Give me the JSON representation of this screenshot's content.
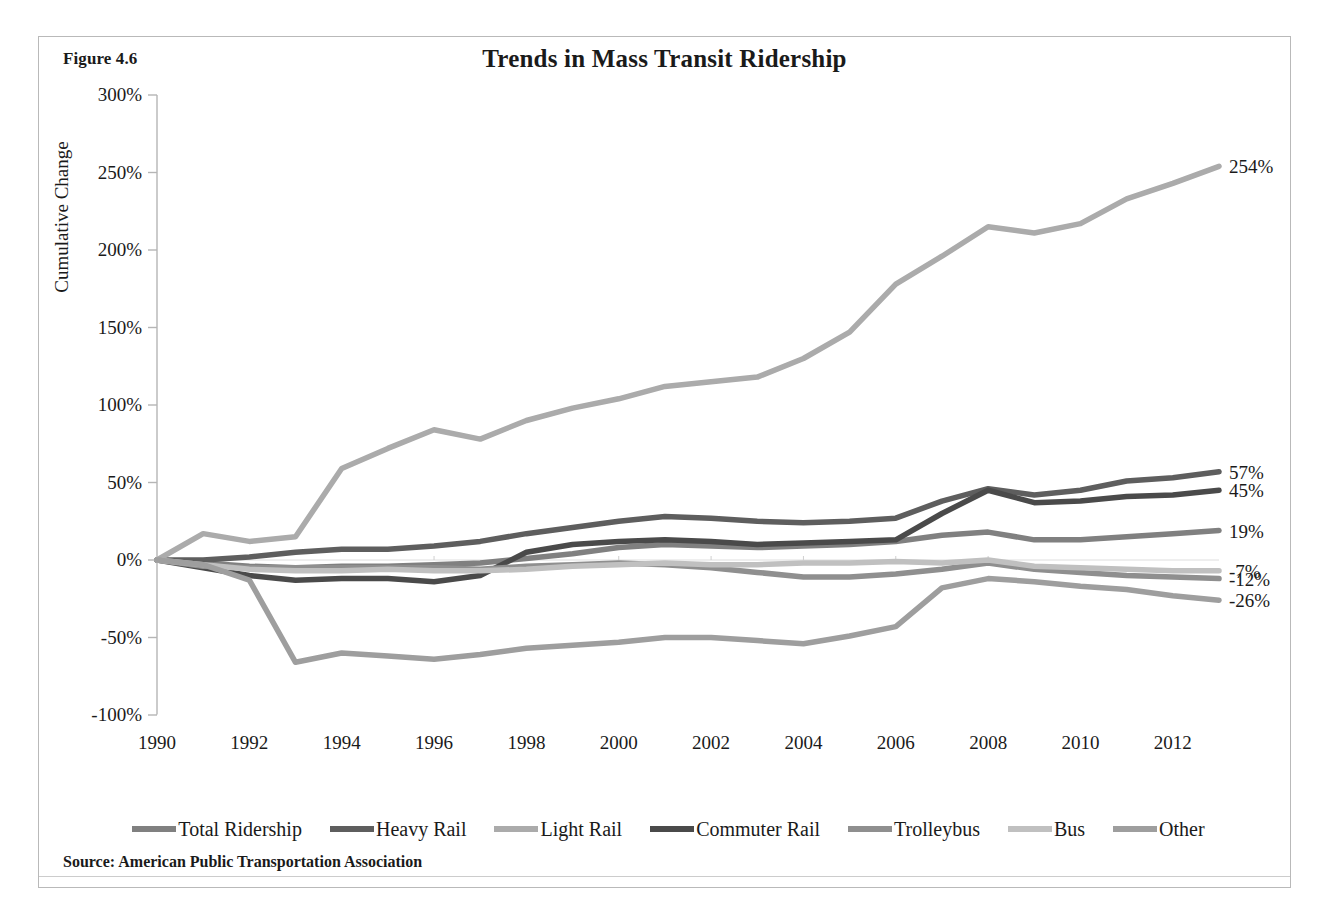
{
  "figure": {
    "label": "Figure 4.6",
    "title": "Trends in Mass Transit Ridership",
    "source": "Source: American Public Transportation Association"
  },
  "axes": {
    "y_title": "Cumulative Change",
    "y_ticks": [
      "300%",
      "250%",
      "200%",
      "150%",
      "100%",
      "50%",
      "0%",
      "-50%",
      "-100%"
    ],
    "x_ticks": [
      "1990",
      "1992",
      "1994",
      "1996",
      "1998",
      "2000",
      "2002",
      "2004",
      "2006",
      "2008",
      "2010",
      "2012"
    ]
  },
  "legend": {
    "items": [
      {
        "label": "Total Ridership",
        "color": "#808080"
      },
      {
        "label": "Heavy Rail",
        "color": "#5e5e5e"
      },
      {
        "label": "Light Rail",
        "color": "#ababab"
      },
      {
        "label": "Commuter Rail",
        "color": "#4a4a4a"
      },
      {
        "label": "Trolleybus",
        "color": "#8f8f8f"
      },
      {
        "label": "Bus",
        "color": "#c0c0c0"
      },
      {
        "label": "Other",
        "color": "#9e9e9e"
      }
    ]
  },
  "end_labels": [
    {
      "text": "254%",
      "series": "Light Rail",
      "value": 254
    },
    {
      "text": "57%",
      "series": "Heavy Rail",
      "value": 57
    },
    {
      "text": "45%",
      "series": "Commuter Rail",
      "value": 45
    },
    {
      "text": "19%",
      "series": "Total Ridership",
      "value": 19
    },
    {
      "text": "-7%",
      "series": "Bus",
      "value": -7
    },
    {
      "text": "-12%",
      "series": "Trolleybus",
      "value": -12
    },
    {
      "text": "-26%",
      "series": "Other",
      "value": -26
    }
  ],
  "chart_data": {
    "type": "line",
    "title": "Trends in Mass Transit Ridership",
    "xlabel": "",
    "ylabel": "Cumulative Change",
    "xlim": [
      1990,
      2013
    ],
    "ylim": [
      -100,
      300
    ],
    "y_tick_step": 50,
    "x_tick_step": 2,
    "grid": false,
    "legend_position": "bottom",
    "units": "percent cumulative change from 1990",
    "x": [
      1990,
      1991,
      1992,
      1993,
      1994,
      1995,
      1996,
      1997,
      1998,
      1999,
      2000,
      2001,
      2002,
      2003,
      2004,
      2005,
      2006,
      2007,
      2008,
      2009,
      2010,
      2011,
      2012,
      2013
    ],
    "series": [
      {
        "name": "Total Ridership",
        "color": "#808080",
        "values": [
          0,
          -2,
          -4,
          -5,
          -4,
          -4,
          -3,
          -2,
          1,
          4,
          8,
          10,
          9,
          8,
          9,
          10,
          12,
          16,
          18,
          13,
          13,
          15,
          17,
          19
        ]
      },
      {
        "name": "Heavy Rail",
        "color": "#5e5e5e",
        "values": [
          0,
          0,
          2,
          5,
          7,
          7,
          9,
          12,
          17,
          21,
          25,
          28,
          27,
          25,
          24,
          25,
          27,
          38,
          46,
          42,
          45,
          51,
          53,
          57
        ]
      },
      {
        "name": "Light Rail",
        "color": "#ababab",
        "values": [
          0,
          17,
          12,
          15,
          59,
          72,
          84,
          78,
          90,
          98,
          104,
          112,
          115,
          118,
          130,
          147,
          178,
          196,
          215,
          211,
          217,
          233,
          243,
          254
        ]
      },
      {
        "name": "Commuter Rail",
        "color": "#4a4a4a",
        "values": [
          0,
          -5,
          -10,
          -13,
          -12,
          -12,
          -14,
          -10,
          5,
          10,
          12,
          13,
          12,
          10,
          11,
          12,
          13,
          30,
          45,
          37,
          38,
          41,
          42,
          45
        ]
      },
      {
        "name": "Trolleybus",
        "color": "#8f8f8f",
        "values": [
          0,
          -4,
          -5,
          -5,
          -5,
          -5,
          -5,
          -6,
          -4,
          -3,
          -2,
          -3,
          -5,
          -8,
          -11,
          -11,
          -9,
          -6,
          -2,
          -6,
          -8,
          -10,
          -11,
          -12
        ]
      },
      {
        "name": "Bus",
        "color": "#c0c0c0",
        "values": [
          0,
          -3,
          -6,
          -7,
          -7,
          -6,
          -7,
          -7,
          -6,
          -4,
          -3,
          -2,
          -3,
          -3,
          -2,
          -2,
          -1,
          -2,
          0,
          -4,
          -5,
          -6,
          -7,
          -7
        ]
      },
      {
        "name": "Other",
        "color": "#9e9e9e",
        "values": [
          0,
          -3,
          -13,
          -66,
          -60,
          -62,
          -64,
          -61,
          -57,
          -55,
          -53,
          -50,
          -50,
          -52,
          -54,
          -49,
          -43,
          -18,
          -12,
          -14,
          -17,
          -19,
          -23,
          -26
        ]
      }
    ]
  }
}
